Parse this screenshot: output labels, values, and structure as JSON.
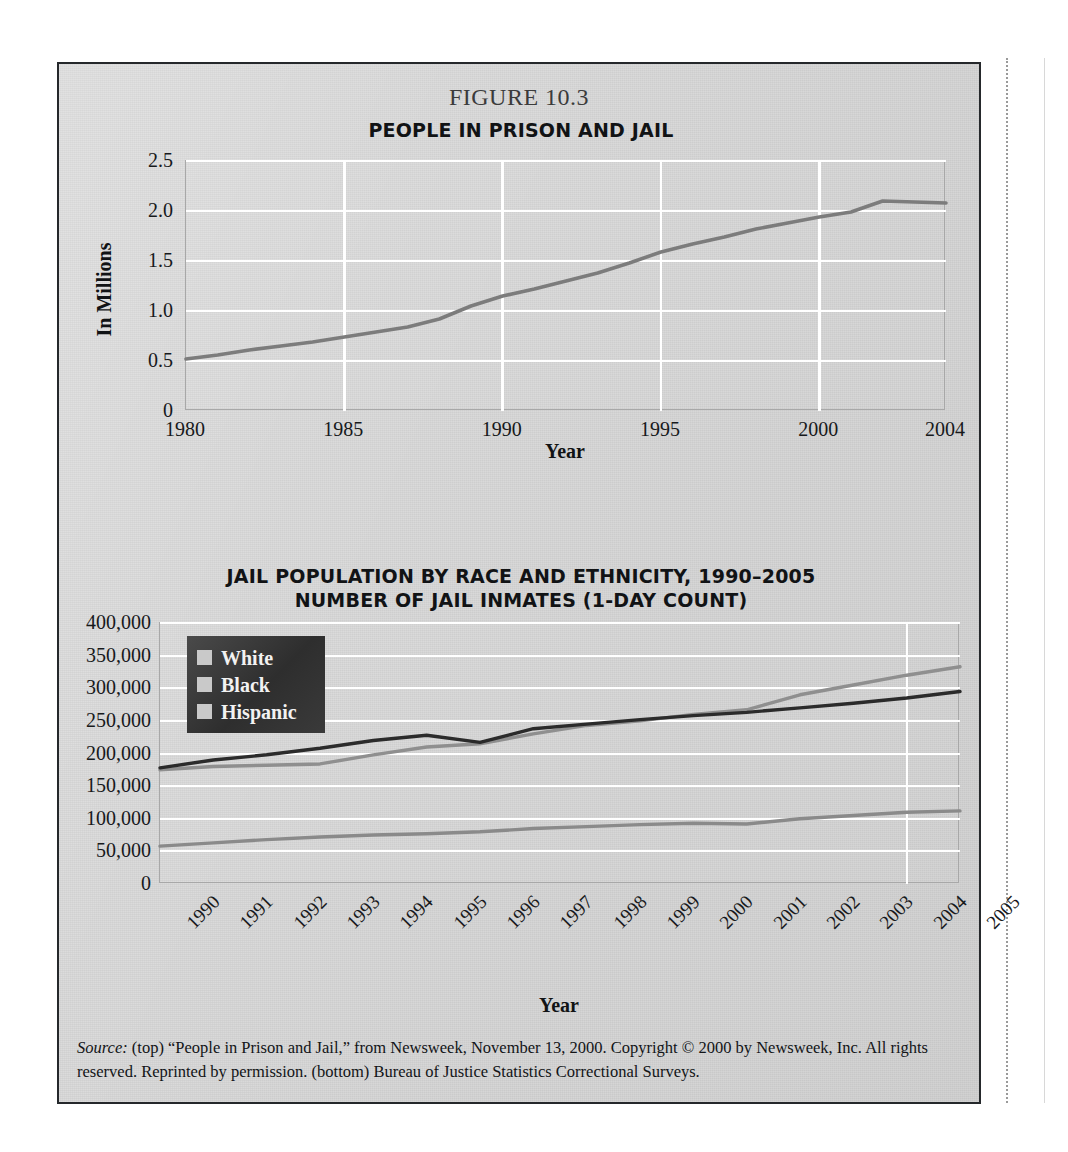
{
  "figure": {
    "number_label": "FIGURE 10.3",
    "caption_source_word": "Source:",
    "caption_text": " (top) “People in Prison and Jail,” from Newsweek, November 13, 2000. Copyright © 2000 by Newsweek, Inc. All rights reserved. Reprinted by permission. (bottom) Bureau of Justice Statistics Correctional Surveys."
  },
  "colors": {
    "panel_background": "#d6d6d6",
    "frame_border": "#25282b",
    "gridline": "#ffffff",
    "plot_border": "#a8a8a8",
    "series_top_line": "#7c7c7c",
    "series_white": "#8f8f8f",
    "series_black": "#2b2b2b",
    "series_hispanic": "#8a8a8a",
    "legend_background": "#333333",
    "legend_swatch": "#c9c9c9",
    "legend_text": "#f2f2f2"
  },
  "chart_data": [
    {
      "id": "people-in-prison-and-jail",
      "type": "line",
      "title": "PEOPLE IN PRISON AND JAIL",
      "xlabel": "Year",
      "ylabel": "In Millions",
      "xlim": [
        1980,
        2004
      ],
      "ylim": [
        0,
        2.5
      ],
      "grid": true,
      "legend": "none",
      "ytick_labels": [
        "2.5",
        "2.0",
        "1.5",
        "1.0",
        "0.5",
        "0"
      ],
      "ytick_values": [
        2.5,
        2.0,
        1.5,
        1.0,
        0.5,
        0
      ],
      "xtick_labels": [
        "1980",
        "1985",
        "1990",
        "1995",
        "2000",
        "2004"
      ],
      "xtick_values": [
        1980,
        1985,
        1990,
        1995,
        2000,
        2004
      ],
      "x": [
        1980,
        1981,
        1982,
        1983,
        1984,
        1985,
        1986,
        1987,
        1988,
        1989,
        1990,
        1991,
        1992,
        1993,
        1994,
        1995,
        1996,
        1997,
        1998,
        1999,
        2000,
        2001,
        2002,
        2003,
        2004
      ],
      "series": [
        {
          "name": "Total people in prison and jail",
          "values": [
            0.52,
            0.56,
            0.61,
            0.65,
            0.69,
            0.74,
            0.79,
            0.84,
            0.92,
            1.05,
            1.15,
            1.22,
            1.3,
            1.38,
            1.48,
            1.59,
            1.67,
            1.74,
            1.82,
            1.88,
            1.94,
            1.99,
            2.1,
            2.09,
            2.08
          ]
        }
      ]
    },
    {
      "id": "jail-population-by-race-and-ethnicity",
      "type": "line",
      "title_line1": "JAIL POPULATION BY RACE AND ETHNICITY, 1990–2005",
      "title_line2": "NUMBER OF JAIL INMATES (1-DAY COUNT)",
      "xlabel": "Year",
      "ylabel": "",
      "xlim": [
        1990,
        2005
      ],
      "ylim": [
        0,
        400000
      ],
      "grid": true,
      "legend": "top-left",
      "ytick_labels": [
        "400,000",
        "350,000",
        "300,000",
        "250,000",
        "200,000",
        "150,000",
        "100,000",
        "50,000",
        "0"
      ],
      "ytick_values": [
        400000,
        350000,
        300000,
        250000,
        200000,
        150000,
        100000,
        50000,
        0
      ],
      "xtick_labels": [
        "1990",
        "1991",
        "1992",
        "1993",
        "1994",
        "1995",
        "1996",
        "1997",
        "1998",
        "1999",
        "2000",
        "2001",
        "2002",
        "2003",
        "2004",
        "2005"
      ],
      "x": [
        1990,
        1991,
        1992,
        1993,
        1994,
        1995,
        1996,
        1997,
        1998,
        1999,
        2000,
        2001,
        2002,
        2003,
        2004,
        2005
      ],
      "series": [
        {
          "name": "White",
          "values": [
            175000,
            180000,
            182000,
            184000,
            198000,
            210000,
            215000,
            230000,
            243000,
            250000,
            260000,
            267000,
            290000,
            305000,
            320000,
            333000
          ]
        },
        {
          "name": "Black",
          "values": [
            178000,
            190000,
            198000,
            208000,
            220000,
            228000,
            217000,
            238000,
            245000,
            252000,
            258000,
            263000,
            270000,
            277000,
            285000,
            295000
          ]
        },
        {
          "name": "Hispanic",
          "values": [
            58000,
            63000,
            68000,
            72000,
            75000,
            77000,
            80000,
            85000,
            88000,
            91000,
            93000,
            92000,
            100000,
            105000,
            110000,
            112000
          ]
        }
      ]
    }
  ]
}
